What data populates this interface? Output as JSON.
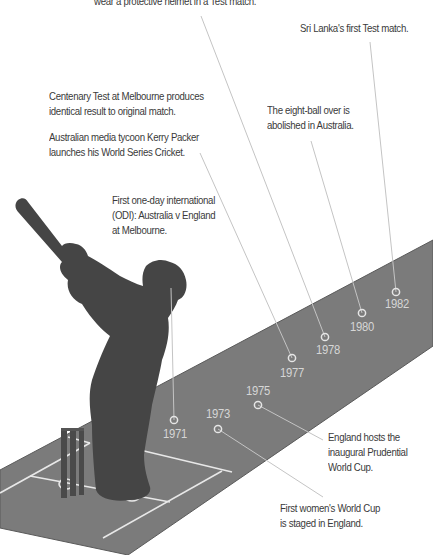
{
  "colors": {
    "pitch": "#7b7b7b",
    "pitch_edge": "#565656",
    "silhouette": "#454545",
    "crease": "#e8e8e8",
    "connector": "#c4c4c4",
    "year_label": "#d6d6d6",
    "note_text": "#3a3a3a"
  },
  "events": [
    {
      "year": "1971",
      "note": "First one-day international\n(ODI): Australia v England\nat Melbourne.",
      "marker": {
        "x": 174,
        "y": 420
      },
      "line_to": {
        "x": 171,
        "y": 288
      },
      "year_pos": {
        "x": 175,
        "y": 427
      },
      "note_pos": {
        "x": 112,
        "y": 193
      }
    },
    {
      "year": "1973",
      "note": "First women's World Cup\nis staged in England.",
      "marker": {
        "x": 218,
        "y": 429
      },
      "line_to": {
        "x": 323,
        "y": 497
      },
      "year_pos": {
        "x": 218,
        "y": 407
      },
      "note_pos": {
        "x": 280,
        "y": 501
      }
    },
    {
      "year": "1975",
      "note": "England hosts the\ninaugural Prudential\nWorld Cup.",
      "marker": {
        "x": 258,
        "y": 405
      },
      "line_to": {
        "x": 323,
        "y": 440
      },
      "year_pos": {
        "x": 258,
        "y": 384
      },
      "note_pos": {
        "x": 328,
        "y": 430
      }
    },
    {
      "year": "1977",
      "note": "Centenary Test at Melbourne produces\nidentical result to original match.",
      "note2": "Australian media tycoon Kerry Packer\nlaunches his World Series Cricket.",
      "marker": {
        "x": 292,
        "y": 358
      },
      "line_to": {
        "x": 200,
        "y": 153
      },
      "year_pos": {
        "x": 292,
        "y": 366
      },
      "note_pos": {
        "x": 49,
        "y": 89
      },
      "note2_pos": {
        "x": 49,
        "y": 130
      }
    },
    {
      "year": "1978",
      "note": "wear a protective helmet in a Test match.",
      "marker": {
        "x": 325,
        "y": 337
      },
      "line_to": {
        "x": 201,
        "y": 16
      },
      "year_pos": {
        "x": 328,
        "y": 343
      },
      "note_pos": {
        "x": 94,
        "y": -6
      }
    },
    {
      "year": "1980",
      "note": "The eight-ball over is\nabolished in Australia.",
      "marker": {
        "x": 362,
        "y": 313
      },
      "line_to": {
        "x": 311,
        "y": 141
      },
      "year_pos": {
        "x": 362,
        "y": 320
      },
      "note_pos": {
        "x": 267,
        "y": 103
      }
    },
    {
      "year": "1982",
      "note": "Sri Lanka's first Test match.",
      "marker": {
        "x": 396,
        "y": 292
      },
      "line_to": {
        "x": 370,
        "y": 42
      },
      "year_pos": {
        "x": 397,
        "y": 297
      },
      "note_pos": {
        "x": 300,
        "y": 21
      }
    }
  ]
}
